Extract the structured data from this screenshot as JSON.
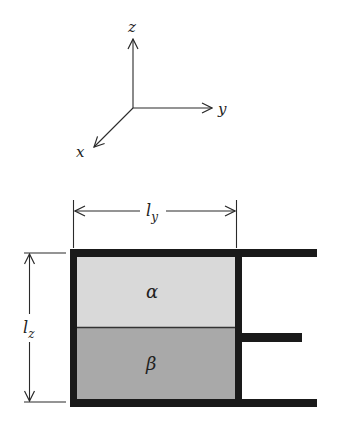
{
  "diagram": {
    "type": "two-phase-container-with-piston",
    "axes": {
      "labels": {
        "x": "x",
        "y": "y",
        "z": "z"
      },
      "origin": [
        133,
        108
      ],
      "z_tip": [
        133,
        38
      ],
      "y_tip": [
        213,
        108
      ],
      "x_tip": [
        93,
        148
      ]
    },
    "dimensions": {
      "width_label_base": "l",
      "width_label_sub": "y",
      "height_label_base": "l",
      "height_label_sub": "z"
    },
    "phases": [
      {
        "symbol": "α",
        "name": "alpha",
        "position": "top",
        "fill": "#d9d9d9"
      },
      {
        "symbol": "β",
        "name": "beta",
        "position": "bottom",
        "fill": "#a9a9a9"
      }
    ],
    "colors": {
      "wall": "#1a1a1a",
      "line": "#2a2a2a",
      "phase_top": "#d9d9d9",
      "phase_bottom": "#a9a9a9",
      "background": "#ffffff"
    }
  }
}
